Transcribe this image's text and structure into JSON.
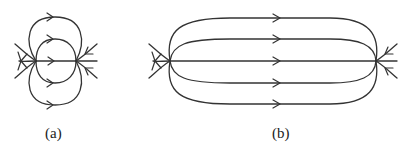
{
  "figures": [
    {
      "id": "a",
      "caption": "(a)",
      "description": "Two-node flow: four curves (two nested loops above and below) plus a straight line from left node to right node; fan of incoming arrows at right node, outgoing split at left node"
    },
    {
      "id": "b",
      "caption": "(b)",
      "description": "Two-node flow with five parallel curves from left node to right node; fan arrows at both nodes"
    }
  ],
  "colors": {
    "stroke": "#333333",
    "background": "#ffffff"
  }
}
